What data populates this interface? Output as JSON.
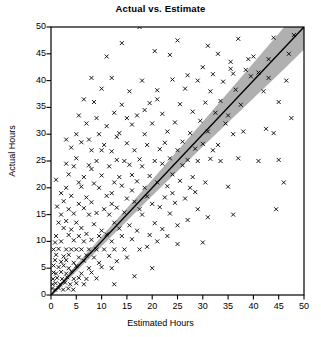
{
  "chart_data": {
    "type": "scatter",
    "title": "Actual vs. Estimate",
    "xlabel": "Estimated Hours",
    "ylabel": "Actual Hours",
    "xlim": [
      0,
      50
    ],
    "ylim": [
      0,
      50
    ],
    "xticks": [
      0,
      5,
      10,
      15,
      20,
      25,
      30,
      35,
      40,
      45,
      50
    ],
    "yticks": [
      0,
      5,
      10,
      15,
      20,
      25,
      30,
      35,
      40,
      45,
      50
    ],
    "grid": false,
    "legend": null,
    "marker": "x",
    "marker_color": "#000000",
    "band_color": "#b0b0b0",
    "line_color": "#000000",
    "fit_line": {
      "intercept": 0.0,
      "slope": 1.0,
      "x_from": 0,
      "x_to": 50
    },
    "confidence_band": {
      "x": [
        0,
        5,
        10,
        15,
        20,
        25,
        30,
        35,
        40,
        45,
        50
      ],
      "upper": [
        0.3,
        5.6,
        10.9,
        16.2,
        21.5,
        26.9,
        32.3,
        37.8,
        43.3,
        48.8,
        54.2
      ],
      "lower": [
        -0.3,
        4.4,
        9.1,
        13.8,
        18.5,
        23.1,
        27.7,
        32.2,
        36.7,
        41.2,
        45.8
      ]
    },
    "points": [
      [
        17.5,
        50.0
      ],
      [
        25.0,
        47.5
      ],
      [
        31.0,
        46.5
      ],
      [
        37.0,
        47.8
      ],
      [
        20.5,
        45.5
      ],
      [
        23.5,
        44.8
      ],
      [
        33.0,
        45.0
      ],
      [
        40.0,
        44.5
      ],
      [
        30.0,
        42.5
      ],
      [
        35.5,
        42.2
      ],
      [
        38.5,
        42.0
      ],
      [
        41.0,
        41.5
      ],
      [
        27.0,
        41.0
      ],
      [
        32.0,
        41.2
      ],
      [
        36.0,
        41.3
      ],
      [
        39.5,
        40.8
      ],
      [
        12.0,
        40.5
      ],
      [
        18.0,
        40.0
      ],
      [
        24.0,
        40.2
      ],
      [
        29.0,
        40.0
      ],
      [
        34.0,
        39.8
      ],
      [
        43.0,
        40.5
      ],
      [
        46.5,
        40.0
      ],
      [
        10.0,
        38.5
      ],
      [
        15.5,
        38.0
      ],
      [
        21.0,
        38.2
      ],
      [
        26.5,
        38.5
      ],
      [
        31.5,
        38.0
      ],
      [
        36.5,
        38.3
      ],
      [
        42.0,
        38.0
      ],
      [
        8.5,
        36.0
      ],
      [
        14.0,
        35.5
      ],
      [
        19.5,
        35.8
      ],
      [
        25.5,
        35.6
      ],
      [
        30.5,
        35.9
      ],
      [
        33.5,
        36.2
      ],
      [
        37.5,
        35.5
      ],
      [
        45.0,
        36.0
      ],
      [
        12.5,
        34.0
      ],
      [
        17.0,
        33.5
      ],
      [
        22.0,
        33.8
      ],
      [
        28.0,
        34.2
      ],
      [
        32.5,
        34.0
      ],
      [
        35.0,
        33.5
      ],
      [
        47.5,
        33.0
      ],
      [
        7.0,
        32.0
      ],
      [
        11.0,
        31.5
      ],
      [
        16.0,
        31.8
      ],
      [
        20.0,
        32.0
      ],
      [
        24.5,
        32.2
      ],
      [
        29.5,
        32.5
      ],
      [
        34.5,
        32.0
      ],
      [
        9.5,
        30.0
      ],
      [
        13.5,
        30.2
      ],
      [
        18.5,
        30.0
      ],
      [
        23.0,
        30.5
      ],
      [
        27.5,
        30.2
      ],
      [
        31.0,
        30.5
      ],
      [
        36.0,
        30.0
      ],
      [
        44.0,
        30.2
      ],
      [
        6.0,
        28.5
      ],
      [
        10.5,
        28.0
      ],
      [
        15.0,
        28.3
      ],
      [
        19.0,
        28.0
      ],
      [
        22.5,
        28.4
      ],
      [
        26.0,
        28.6
      ],
      [
        30.0,
        28.2
      ],
      [
        33.0,
        28.0
      ],
      [
        8.0,
        27.0
      ],
      [
        12.0,
        26.8
      ],
      [
        16.5,
        27.0
      ],
      [
        21.5,
        27.2
      ],
      [
        25.0,
        27.0
      ],
      [
        28.5,
        27.3
      ],
      [
        32.0,
        27.0
      ],
      [
        5.0,
        25.5
      ],
      [
        9.0,
        25.0
      ],
      [
        13.0,
        25.2
      ],
      [
        14.5,
        25.0
      ],
      [
        17.5,
        25.3
      ],
      [
        20.5,
        25.0
      ],
      [
        23.5,
        25.5
      ],
      [
        27.0,
        25.2
      ],
      [
        29.0,
        25.0
      ],
      [
        31.5,
        25.4
      ],
      [
        4.5,
        24.0
      ],
      [
        7.5,
        24.2
      ],
      [
        11.5,
        24.0
      ],
      [
        15.5,
        24.3
      ],
      [
        18.0,
        24.0
      ],
      [
        22.0,
        24.5
      ],
      [
        26.0,
        24.2
      ],
      [
        3.5,
        22.5
      ],
      [
        6.5,
        22.0
      ],
      [
        10.0,
        22.3
      ],
      [
        13.5,
        22.0
      ],
      [
        16.0,
        22.4
      ],
      [
        19.5,
        22.2
      ],
      [
        24.0,
        22.5
      ],
      [
        28.0,
        22.0
      ],
      [
        5.5,
        21.0
      ],
      [
        8.5,
        20.8
      ],
      [
        12.5,
        21.0
      ],
      [
        17.0,
        21.2
      ],
      [
        21.0,
        21.0
      ],
      [
        25.5,
        21.3
      ],
      [
        30.5,
        21.0
      ],
      [
        3.0,
        20.0
      ],
      [
        6.0,
        20.2
      ],
      [
        9.5,
        20.0
      ],
      [
        14.0,
        20.4
      ],
      [
        18.5,
        20.0
      ],
      [
        23.0,
        20.3
      ],
      [
        27.5,
        20.0
      ],
      [
        35.0,
        20.2
      ],
      [
        4.0,
        18.5
      ],
      [
        7.0,
        18.2
      ],
      [
        11.0,
        18.5
      ],
      [
        15.0,
        18.0
      ],
      [
        19.0,
        18.4
      ],
      [
        22.5,
        18.2
      ],
      [
        26.5,
        18.0
      ],
      [
        2.5,
        17.5
      ],
      [
        5.5,
        17.0
      ],
      [
        8.0,
        17.3
      ],
      [
        12.0,
        17.0
      ],
      [
        16.5,
        17.4
      ],
      [
        20.0,
        17.0
      ],
      [
        24.5,
        17.2
      ],
      [
        3.5,
        16.0
      ],
      [
        6.5,
        16.2
      ],
      [
        10.5,
        16.0
      ],
      [
        13.0,
        16.3
      ],
      [
        17.5,
        16.0
      ],
      [
        21.5,
        16.4
      ],
      [
        29.0,
        16.0
      ],
      [
        2.0,
        15.0
      ],
      [
        4.5,
        15.2
      ],
      [
        7.5,
        15.0
      ],
      [
        9.0,
        15.3
      ],
      [
        11.5,
        15.0
      ],
      [
        14.5,
        15.4
      ],
      [
        18.0,
        15.0
      ],
      [
        23.5,
        15.2
      ],
      [
        1.5,
        13.5
      ],
      [
        3.0,
        13.8
      ],
      [
        5.0,
        13.5
      ],
      [
        8.5,
        13.2
      ],
      [
        12.5,
        13.5
      ],
      [
        15.5,
        13.0
      ],
      [
        20.5,
        13.4
      ],
      [
        25.0,
        13.0
      ],
      [
        2.5,
        12.5
      ],
      [
        4.0,
        12.2
      ],
      [
        6.0,
        12.5
      ],
      [
        10.0,
        12.0
      ],
      [
        13.5,
        12.4
      ],
      [
        17.0,
        12.0
      ],
      [
        22.0,
        12.3
      ],
      [
        1.0,
        11.0
      ],
      [
        3.5,
        11.2
      ],
      [
        5.5,
        11.0
      ],
      [
        7.0,
        11.4
      ],
      [
        9.5,
        11.0
      ],
      [
        11.0,
        11.3
      ],
      [
        14.0,
        11.0
      ],
      [
        19.5,
        11.2
      ],
      [
        0.8,
        9.8
      ],
      [
        2.0,
        10.0
      ],
      [
        4.5,
        10.2
      ],
      [
        6.5,
        10.0
      ],
      [
        8.0,
        10.3
      ],
      [
        12.0,
        10.0
      ],
      [
        16.0,
        10.4
      ],
      [
        21.0,
        10.0
      ],
      [
        0.5,
        8.5
      ],
      [
        1.5,
        8.6
      ],
      [
        3.0,
        8.5
      ],
      [
        4.0,
        8.5
      ],
      [
        5.0,
        8.5
      ],
      [
        6.0,
        8.5
      ],
      [
        7.5,
        8.5
      ],
      [
        9.0,
        8.5
      ],
      [
        10.5,
        8.5
      ],
      [
        12.5,
        8.5
      ],
      [
        14.5,
        8.5
      ],
      [
        17.5,
        8.5
      ],
      [
        1.0,
        7.5
      ],
      [
        2.5,
        7.2
      ],
      [
        3.5,
        7.5
      ],
      [
        5.5,
        7.0
      ],
      [
        7.0,
        7.4
      ],
      [
        8.5,
        7.0
      ],
      [
        11.5,
        7.3
      ],
      [
        15.0,
        7.0
      ],
      [
        0.8,
        6.5
      ],
      [
        2.0,
        6.2
      ],
      [
        3.0,
        6.5
      ],
      [
        4.5,
        6.0
      ],
      [
        6.5,
        6.4
      ],
      [
        9.5,
        6.0
      ],
      [
        13.0,
        6.3
      ],
      [
        0.5,
        5.5
      ],
      [
        1.5,
        5.2
      ],
      [
        2.5,
        5.5
      ],
      [
        3.5,
        5.0
      ],
      [
        5.0,
        5.4
      ],
      [
        7.5,
        5.0
      ],
      [
        10.0,
        5.2
      ],
      [
        12.0,
        5.0
      ],
      [
        0.5,
        4.2
      ],
      [
        1.0,
        4.0
      ],
      [
        2.0,
        4.3
      ],
      [
        3.0,
        4.0
      ],
      [
        4.0,
        4.4
      ],
      [
        6.0,
        4.0
      ],
      [
        8.0,
        4.2
      ],
      [
        0.4,
        3.0
      ],
      [
        1.2,
        3.2
      ],
      [
        2.2,
        3.0
      ],
      [
        3.2,
        3.3
      ],
      [
        4.5,
        3.0
      ],
      [
        5.5,
        3.2
      ],
      [
        7.0,
        3.0
      ],
      [
        9.0,
        3.1
      ],
      [
        0.3,
        2.0
      ],
      [
        0.9,
        2.2
      ],
      [
        1.8,
        2.0
      ],
      [
        2.8,
        2.3
      ],
      [
        3.8,
        2.0
      ],
      [
        5.0,
        2.2
      ],
      [
        6.5,
        2.0
      ],
      [
        0.2,
        1.2
      ],
      [
        0.8,
        1.0
      ],
      [
        1.5,
        1.3
      ],
      [
        2.4,
        1.0
      ],
      [
        3.4,
        1.2
      ],
      [
        4.4,
        1.0
      ],
      [
        14.0,
        47.0
      ],
      [
        11.0,
        44.5
      ],
      [
        9.0,
        33.0
      ],
      [
        5.0,
        30.0
      ],
      [
        6.5,
        36.5
      ],
      [
        4.0,
        27.5
      ],
      [
        3.0,
        24.5
      ],
      [
        7.5,
        29.0
      ],
      [
        13.0,
        29.5
      ],
      [
        10.0,
        27.0
      ],
      [
        8.0,
        23.5
      ],
      [
        15.0,
        33.0
      ],
      [
        18.5,
        34.5
      ],
      [
        21.0,
        36.5
      ],
      [
        12.0,
        19.0
      ],
      [
        16.0,
        19.5
      ],
      [
        24.0,
        19.0
      ],
      [
        28.5,
        19.2
      ],
      [
        33.5,
        25.0
      ],
      [
        37.0,
        25.5
      ],
      [
        41.0,
        25.0
      ],
      [
        45.0,
        25.2
      ],
      [
        38.0,
        30.5
      ],
      [
        42.5,
        31.0
      ],
      [
        46.0,
        21.0
      ],
      [
        44.5,
        16.0
      ],
      [
        36.0,
        15.0
      ],
      [
        31.0,
        14.5
      ],
      [
        27.0,
        14.0
      ],
      [
        23.0,
        11.0
      ],
      [
        19.0,
        9.0
      ],
      [
        25.0,
        9.5
      ],
      [
        30.0,
        9.8
      ],
      [
        20.0,
        5.0
      ],
      [
        16.5,
        3.5
      ],
      [
        12.5,
        2.0
      ],
      [
        43.0,
        44.0
      ],
      [
        47.0,
        45.0
      ],
      [
        48.0,
        48.5
      ],
      [
        44.0,
        48.0
      ],
      [
        39.0,
        44.0
      ],
      [
        35.5,
        43.5
      ],
      [
        2.0,
        19.0
      ],
      [
        1.2,
        16.5
      ],
      [
        3.0,
        29.0
      ],
      [
        1.0,
        21.5
      ],
      [
        8.0,
        40.5
      ],
      [
        5.5,
        33.5
      ]
    ]
  }
}
